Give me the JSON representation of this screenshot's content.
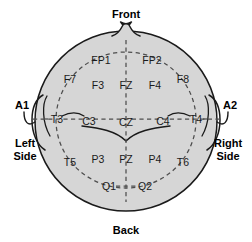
{
  "diagram": {
    "type": "head-map",
    "colors": {
      "head_fill": "#d6d6d6",
      "head_stroke": "#1a1a1a",
      "dashed_stroke": "#4d4d4d",
      "text": "#111111",
      "background": "#ffffff"
    },
    "orientation": {
      "front": "Front",
      "back": "Back",
      "left": "Left\nSide",
      "left_line1": "Left",
      "left_line2": "Side",
      "right_line1": "Right",
      "right_line2": "Side"
    },
    "reference_electrodes": [
      {
        "label": "A1",
        "x": 22,
        "y": 105,
        "side": "left-ear"
      },
      {
        "label": "A2",
        "x": 230,
        "y": 105,
        "side": "right-ear"
      }
    ],
    "electrodes": [
      {
        "label": "FP1",
        "x": 101,
        "y": 60
      },
      {
        "label": "FP2",
        "x": 152,
        "y": 60
      },
      {
        "label": "F7",
        "x": 70,
        "y": 79
      },
      {
        "label": "F3",
        "x": 98,
        "y": 85
      },
      {
        "label": "FZ",
        "x": 126,
        "y": 85
      },
      {
        "label": "F4",
        "x": 155,
        "y": 85
      },
      {
        "label": "F8",
        "x": 183,
        "y": 79
      },
      {
        "label": "T3",
        "x": 57,
        "y": 119
      },
      {
        "label": "C3",
        "x": 89,
        "y": 121
      },
      {
        "label": "CZ",
        "x": 126,
        "y": 122
      },
      {
        "label": "C4",
        "x": 163,
        "y": 121
      },
      {
        "label": "T4",
        "x": 196,
        "y": 119
      },
      {
        "label": "T5",
        "x": 70,
        "y": 162
      },
      {
        "label": "P3",
        "x": 98,
        "y": 159
      },
      {
        "label": "PZ",
        "x": 126,
        "y": 159
      },
      {
        "label": "P4",
        "x": 155,
        "y": 159
      },
      {
        "label": "T6",
        "x": 183,
        "y": 162
      },
      {
        "label": "Q1",
        "x": 109,
        "y": 186
      },
      {
        "label": "Q2",
        "x": 145,
        "y": 186
      }
    ]
  }
}
